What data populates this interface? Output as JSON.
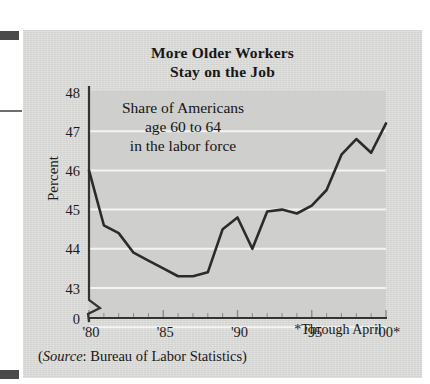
{
  "figure": {
    "background_color": "#d8d8d6",
    "page_color": "#ffffff",
    "line_color": "#2b2b2b",
    "gridline_color": "#f4f4f2",
    "axis_color": "#333333"
  },
  "title_line1": "More Older Workers",
  "title_line2": "Stay on the Job",
  "annotation_line1": "Share of Americans",
  "annotation_line2": "age 60 to 64",
  "annotation_line3": "in the labor force",
  "footnote": "*Through April",
  "source_prefix": "(",
  "source_label": "Source",
  "source_text": ": Bureau of Labor Statistics)",
  "chart_data": {
    "type": "line",
    "title": "More Older Workers Stay on the Job",
    "subtitle": "Share of Americans age 60 to 64 in the labor force",
    "xlabel": "",
    "ylabel": "Percent",
    "xlim": [
      1980,
      2000
    ],
    "ylim": [
      42.6,
      48
    ],
    "yticks": [
      43,
      44,
      45,
      46,
      47,
      48
    ],
    "ytick_labels": [
      "43",
      "44",
      "45",
      "46",
      "47",
      "48"
    ],
    "y_origin_label": "0",
    "axis_break": true,
    "xticks": [
      1980,
      1985,
      1990,
      1995,
      2000
    ],
    "xtick_labels": [
      "'80",
      "'85",
      "'90",
      "'95",
      "'00*"
    ],
    "x_minor_ticks": true,
    "grid": "horizontal",
    "legend": "none",
    "x": [
      1980,
      1981,
      1982,
      1983,
      1984,
      1985,
      1986,
      1987,
      1988,
      1989,
      1990,
      1991,
      1992,
      1993,
      1994,
      1995,
      1996,
      1997,
      1998,
      1999,
      2000
    ],
    "values": [
      46.0,
      44.6,
      44.4,
      43.9,
      43.7,
      43.5,
      43.3,
      43.3,
      43.4,
      44.5,
      44.8,
      44.0,
      44.95,
      45.0,
      44.9,
      45.1,
      45.5,
      46.4,
      46.8,
      46.45,
      47.2
    ],
    "series": [
      {
        "name": "Share of Americans age 60 to 64 in the labor force",
        "values": [
          46.0,
          44.6,
          44.4,
          43.9,
          43.7,
          43.5,
          43.3,
          43.3,
          43.4,
          44.5,
          44.8,
          44.0,
          44.95,
          45.0,
          44.9,
          45.1,
          45.5,
          46.4,
          46.8,
          46.45,
          47.2
        ],
        "color": "#2b2b2b"
      }
    ],
    "units": "percent",
    "note": "2000 value is through April"
  }
}
